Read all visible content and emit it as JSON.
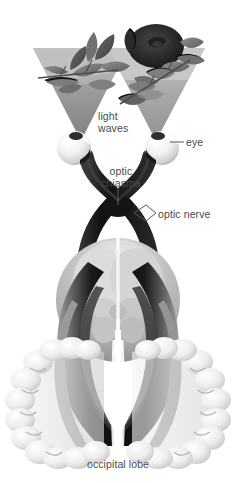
{
  "figure": {
    "background_color": "#ffffff",
    "label_color": "#4a4a4a"
  },
  "labels": {
    "light_waves_line1": "light",
    "light_waves_line2": "waves",
    "eye": "eye",
    "optic_chiasma_line1": "optic",
    "optic_chiasma_line2": "chiasma",
    "optic_nerve": "optic nerve",
    "occipital_lobe": "occipital lobe"
  },
  "parts": {
    "left_light_cone": "left-light-cone",
    "right_light_cone": "right-light-cone",
    "left_eyeball": "left-eyeball",
    "right_eyeball": "right-eyeball",
    "left_optic_nerve": "left-optic-nerve",
    "right_optic_nerve": "right-optic-nerve",
    "optic_chiasma": "optic-chiasma",
    "left_optic_tract": "left-optic-tract",
    "right_optic_tract": "right-optic-tract",
    "brainstem_thalamus": "brainstem-thalamus",
    "left_occipital_lobe": "left-occipital-lobe",
    "right_occipital_lobe": "right-occipital-lobe",
    "foliage_left": "foliage-leaves",
    "foliage_right": "rose-bloom"
  },
  "colors": {
    "nerve_dark": "#121212",
    "nerve_mid": "#2c2c2c",
    "cone_gray": "#8f9193",
    "cone_gray_light": "#a8aaac",
    "foliage_gray": "#76787a",
    "foliage_dark": "#2a2a2c",
    "brain_light": "#e9e9e9",
    "brain_mid": "#c2c2c2",
    "brain_shadow": "#9a9a9a",
    "eyeball_white": "#fbfbfb",
    "leader_line": "#5a5a5a"
  }
}
